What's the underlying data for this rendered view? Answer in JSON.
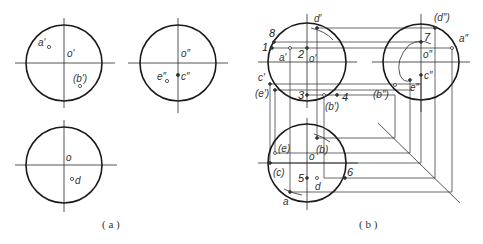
{
  "figure_a": {
    "caption": "( a )",
    "front_view": {
      "center_label": "o′",
      "points": [
        {
          "label": "a′"
        },
        {
          "label": "(b′)"
        }
      ]
    },
    "side_view": {
      "center_label": "o″",
      "points": [
        {
          "label": "e″"
        },
        {
          "label": "c″"
        }
      ]
    },
    "top_view": {
      "center_label": "o",
      "points": [
        {
          "label": "d"
        }
      ]
    }
  },
  "figure_b": {
    "caption": "( b )",
    "front_view": {
      "center_label": "o′",
      "point_labels": {
        "d": "d′",
        "a": "a′",
        "c": "c′",
        "e": "(e′)",
        "b": "(b′)"
      },
      "numbers": {
        "n1": "1",
        "n2": "2",
        "n3": "3",
        "n4": "4",
        "n8": "8"
      }
    },
    "side_view": {
      "center_label": "o″",
      "point_labels": {
        "d": "(d″)",
        "a": "a″",
        "c": "c″",
        "e": "e″",
        "b": "(b″)"
      },
      "numbers": {
        "n7": "7"
      }
    },
    "top_view": {
      "center_label": "o",
      "point_labels": {
        "e": "(e)",
        "b": "(b)",
        "c": "(c)",
        "d": "d",
        "a": "a"
      },
      "numbers": {
        "n5": "5",
        "n6": "6"
      }
    }
  }
}
